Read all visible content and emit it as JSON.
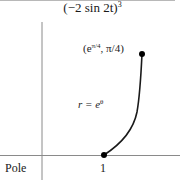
{
  "header": {
    "formula_base": "(−2 sin 2t)",
    "formula_exponent": "3"
  },
  "diagram": {
    "axis_label_origin": "Pole",
    "tick_label": "1",
    "point_label": {
      "open": "(e",
      "exponent": "π/4",
      "rest": ", π/4)"
    },
    "curve_label": {
      "lhs": "r = e",
      "exponent": "θ"
    },
    "points": [
      {
        "name": "start",
        "r": 1,
        "theta": 0
      },
      {
        "name": "end",
        "r": "e^(π/4)",
        "theta": "π/4"
      }
    ],
    "colors": {
      "axis": "#8a8a8a",
      "curve": "#1a1a1a",
      "dot": "#000000"
    }
  }
}
